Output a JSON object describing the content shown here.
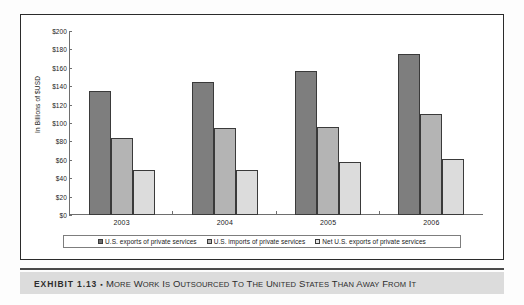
{
  "chart_data": {
    "type": "bar",
    "title": "",
    "subtitle": "",
    "xlabel": "",
    "ylabel": "In Billions of $USD",
    "categories": [
      "2003",
      "2004",
      "2005",
      "2006"
    ],
    "ylim": [
      0,
      200
    ],
    "ytick_labels": [
      "$200",
      "$180",
      "$160",
      "$140",
      "$120",
      "$100",
      "$80",
      "$60",
      "$40",
      "$20",
      "$0"
    ],
    "ytick_values": [
      200,
      180,
      160,
      140,
      120,
      100,
      80,
      60,
      40,
      20,
      0
    ],
    "grid": false,
    "legend_position": "bottom",
    "series": [
      {
        "name": "U.S. exports of private services",
        "color": "#7e7e7e",
        "values": [
          135,
          145,
          157,
          175
        ]
      },
      {
        "name": "U.S. imports of private services",
        "color": "#b4b4b4",
        "values": [
          84,
          95,
          96,
          110
        ]
      },
      {
        "name": "Net U.S. exports of private services",
        "color": "#dcdcdc",
        "values": [
          49,
          49,
          58,
          61
        ]
      }
    ]
  },
  "caption": {
    "exhibit_number": "EXHIBIT 1.13",
    "separator": "▪",
    "title": "More Work is Outsourced to the United States than Away from It"
  }
}
